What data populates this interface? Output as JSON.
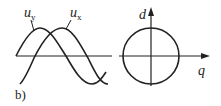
{
  "figure": {
    "caption": "b)",
    "waveforms": {
      "labels": [
        {
          "var": "u",
          "sub": "y"
        },
        {
          "var": "u",
          "sub": "x"
        }
      ]
    },
    "phasor_plot": {
      "vertical_axis": "d",
      "horizontal_axis": "q",
      "shape": "circle"
    },
    "colors": {
      "stroke": "#222222",
      "background": "#ffffff"
    }
  }
}
